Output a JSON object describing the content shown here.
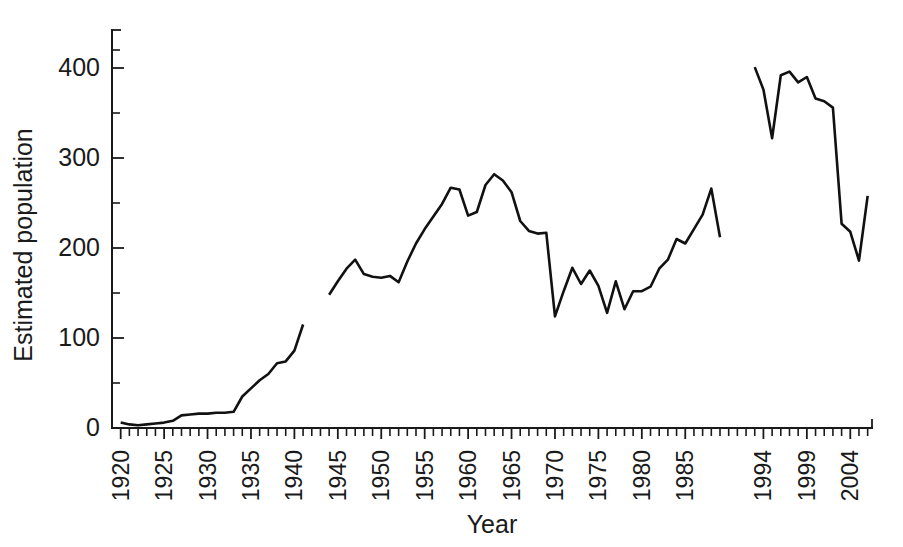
{
  "chart_data": {
    "type": "line",
    "title": "",
    "subtitle": "",
    "xlabel": "Year",
    "ylabel": "Estimated population",
    "xlim": [
      1919.0,
      2006.5
    ],
    "ylim": [
      0,
      430
    ],
    "yticks": [
      0,
      100,
      200,
      300,
      400
    ],
    "yticks_minor": [
      50,
      150,
      250,
      350,
      420
    ],
    "ytick_labels": [
      "0",
      "100",
      "200",
      "300",
      "400"
    ],
    "xticks_labeled": [
      1920,
      1925,
      1930,
      1935,
      1940,
      1945,
      1950,
      1955,
      1960,
      1965,
      1970,
      1975,
      1980,
      1985,
      1994,
      1999,
      2004
    ],
    "xtick_labels": [
      "1920",
      "1925",
      "1930",
      "1935",
      "1940",
      "1945",
      "1950",
      "1955",
      "1960",
      "1965",
      "1970",
      "1975",
      "1980",
      "1985",
      "1994",
      "1999",
      "2004"
    ],
    "xtick_label_rotation": -90,
    "xtick_minor_step": 1,
    "grid": false,
    "legend": false,
    "line_color": "#111111",
    "series": [
      {
        "name": "Estimated population",
        "segments": [
          {
            "label": "1920-1941",
            "x": [
              1920,
              1921,
              1922,
              1923,
              1924,
              1925,
              1926,
              1927,
              1928,
              1929,
              1930,
              1931,
              1932,
              1933,
              1934,
              1935,
              1936,
              1937,
              1938,
              1939,
              1940,
              1941
            ],
            "y": [
              6,
              4,
              3,
              4,
              5,
              6,
              8,
              14,
              15,
              16,
              16,
              17,
              17,
              18,
              35,
              44,
              53,
              60,
              72,
              74,
              86,
              115
            ]
          },
          {
            "label": "1944-1989",
            "x": [
              1944,
              1945,
              1946,
              1947,
              1948,
              1949,
              1950,
              1951,
              1952,
              1953,
              1954,
              1955,
              1956,
              1957,
              1958,
              1959,
              1960,
              1961,
              1962,
              1963,
              1964,
              1965,
              1966,
              1967,
              1968,
              1969,
              1970,
              1971,
              1972,
              1973,
              1974,
              1975,
              1976,
              1977,
              1978,
              1979,
              1980,
              1981,
              1982,
              1983,
              1984,
              1985,
              1986,
              1987,
              1988,
              1989
            ],
            "y": [
              148,
              163,
              177,
              187,
              171,
              168,
              167,
              169,
              162,
              185,
              205,
              221,
              235,
              249,
              267,
              265,
              236,
              240,
              270,
              282,
              275,
              262,
              230,
              219,
              216,
              217,
              124,
              152,
              178,
              160,
              175,
              158,
              128,
              163,
              132,
              152,
              152,
              157,
              177,
              187,
              210,
              205,
              221,
              237,
              266,
              212
            ]
          },
          {
            "label": "1993-2006",
            "x": [
              1993,
              1994,
              1995,
              1996,
              1997,
              1998,
              1999,
              2000,
              2001,
              2002,
              2003,
              2004,
              2005,
              2006
            ],
            "y": [
              401,
              376,
              322,
              392,
              396,
              384,
              390,
              366,
              363,
              356,
              227,
              218,
              186,
              258
            ]
          }
        ]
      }
    ]
  },
  "axis_labels": {
    "y_title": "Estimated population",
    "x_title": "Year"
  }
}
